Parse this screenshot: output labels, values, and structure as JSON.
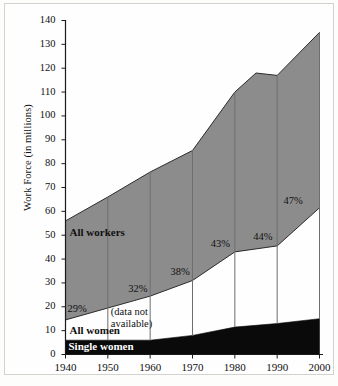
{
  "chart_data": {
    "type": "area",
    "title": "",
    "subtitle": "",
    "xlabel": "",
    "ylabel": "Work Force (in millions)",
    "xlim": [
      1940,
      2000
    ],
    "ylim": [
      0,
      140
    ],
    "grid": false,
    "legend_position": "inline-labels",
    "x": [
      1940,
      1950,
      1960,
      1970,
      1980,
      1985,
      1990,
      2000
    ],
    "categories": [
      "1940",
      "1950",
      "1960",
      "1970",
      "1980",
      "1990",
      "2000"
    ],
    "xtick_labels": [
      "1940",
      "1950",
      "1960",
      "1970",
      "1980",
      "1990",
      "2000"
    ],
    "ytick_labels": [
      "0",
      "10",
      "20",
      "30",
      "40",
      "50",
      "60",
      "70",
      "80",
      "90",
      "100",
      "110",
      "120",
      "130",
      "140"
    ],
    "ytick_values": [
      0,
      10,
      20,
      30,
      40,
      50,
      60,
      70,
      80,
      90,
      100,
      110,
      120,
      130,
      140
    ],
    "series": [
      {
        "name": "All workers",
        "label": "All workers",
        "color": "#8c8c8c",
        "x": [
          1940,
          1950,
          1960,
          1970,
          1980,
          1985,
          1990,
          2000
        ],
        "values": [
          56,
          66,
          76.5,
          85.5,
          110,
          118,
          117,
          135
        ]
      },
      {
        "name": "All women",
        "label": "All women",
        "color": "#ffffff",
        "x": [
          1940,
          1950,
          1960,
          1970,
          1980,
          1990,
          2000
        ],
        "values": [
          14.5,
          19.5,
          24.5,
          31,
          43,
          45.5,
          61.5
        ]
      },
      {
        "name": "Single women",
        "label": "Single women",
        "color": "#0a0a0a",
        "x": [
          1940,
          1950,
          1960,
          1970,
          1980,
          1990,
          2000
        ],
        "values": [
          6,
          6,
          6,
          8,
          11.5,
          13,
          15
        ]
      }
    ],
    "annotations": [
      {
        "text": "29%",
        "x": 1940,
        "y": 18.5
      },
      {
        "text": "(data not\navailable)",
        "x": 1950,
        "y": 17
      },
      {
        "text": "32%",
        "x": 1960,
        "y": 27
      },
      {
        "text": "38%",
        "x": 1970,
        "y": 34
      },
      {
        "text": "43%",
        "x": 1980,
        "y": 46
      },
      {
        "text": "44%",
        "x": 1990,
        "y": 49
      },
      {
        "text": "47%",
        "x": 2000,
        "y": 64
      }
    ],
    "percent_labels": [
      "29%",
      "32%",
      "38%",
      "43%",
      "44%",
      "47%"
    ],
    "note": "(data not available)",
    "note_line1": "(data not",
    "note_line2": "available)",
    "colors": {
      "workers_band": "#8c8c8c",
      "single_women_band": "#0a0a0a",
      "women_band": "#ffffff",
      "axis": "#1a1a1a",
      "divider": "#6e6e6e",
      "frame": "#d2d2cf"
    }
  },
  "axis": {
    "y_title": "Work Force (in millions)",
    "y_ticks": [
      "140",
      "130",
      "120",
      "110",
      "100",
      "90",
      "80",
      "70",
      "60",
      "50",
      "40",
      "30",
      "20",
      "10",
      "0"
    ],
    "x_ticks": [
      "1940",
      "1950",
      "1960",
      "1970",
      "1980",
      "1990",
      "2000"
    ]
  },
  "labels": {
    "all_workers": "All workers",
    "all_women": "All women",
    "single_women": "Single women",
    "pct_1940": "29%",
    "pct_1960": "32%",
    "pct_1970": "38%",
    "pct_1980": "43%",
    "pct_1990": "44%",
    "pct_2000": "47%",
    "note_line1": "(data not",
    "note_line2": "available)"
  }
}
